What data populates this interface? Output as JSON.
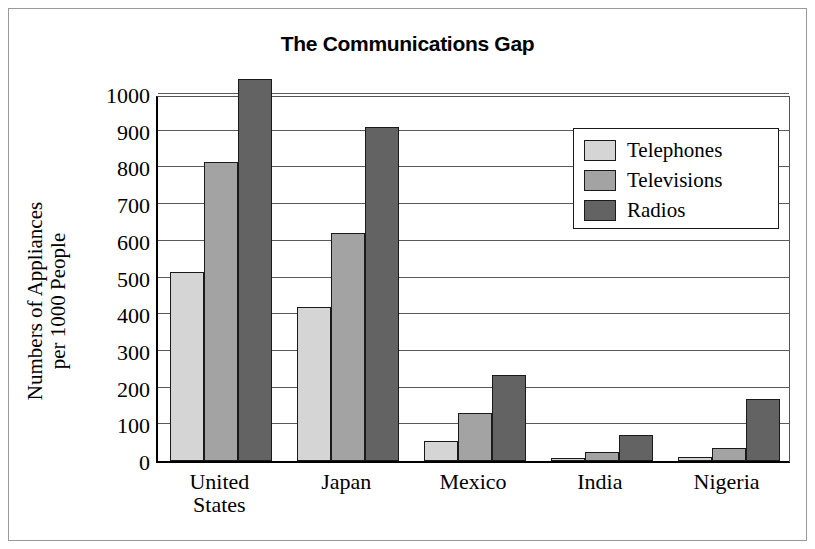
{
  "chart_data": {
    "type": "bar",
    "title": "The Communications Gap",
    "xlabel": "",
    "ylabel": "Numbers of Appliances per 1000 People",
    "ylabel_lines": [
      "Numbers of Appliances",
      "per 1000 People"
    ],
    "categories": [
      "United States",
      "Japan",
      "Mexico",
      "India",
      "Nigeria"
    ],
    "category_lines": [
      [
        "United",
        "States"
      ],
      [
        "Japan"
      ],
      [
        "Mexico"
      ],
      [
        "India"
      ],
      [
        "Nigeria"
      ]
    ],
    "series": [
      {
        "name": "Telephones",
        "color": "#d5d5d5",
        "values": [
          515,
          420,
          55,
          8,
          10
        ]
      },
      {
        "name": "Televisions",
        "color": "#a3a3a3",
        "values": [
          815,
          620,
          130,
          25,
          35
        ]
      },
      {
        "name": "Radios",
        "color": "#636363",
        "values": [
          1040,
          910,
          235,
          70,
          170
        ]
      }
    ],
    "ylim": [
      0,
      1000
    ],
    "ytick_values": [
      0,
      100,
      200,
      300,
      400,
      500,
      600,
      700,
      800,
      900,
      1000
    ],
    "ytick_labels": [
      "0",
      "100",
      "200",
      "300",
      "400",
      "500",
      "600",
      "700",
      "800",
      "900",
      "1000"
    ],
    "grid": true,
    "legend_position": "upper right",
    "legend_entries": [
      "Telephones",
      "Televisions",
      "Radios"
    ]
  }
}
